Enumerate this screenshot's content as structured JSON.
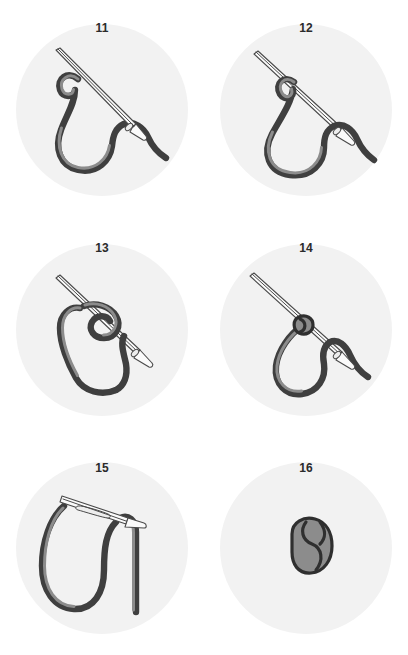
{
  "figure": {
    "background_color": "#ffffff",
    "disc_color": "#f2f2f2",
    "cord_color": "#3f3f3f",
    "cord_highlight_color": "#8c8c8c",
    "needle_color": "#fbfbfb",
    "needle_outline_color": "#4a4a4a",
    "number_color": "#2b2b2b"
  },
  "panels": [
    {
      "number": "11",
      "name": "panel-step-11",
      "description": "Needle held diagonally with cord forming an open hook-shaped loop beside it"
    },
    {
      "number": "12",
      "name": "panel-step-12",
      "description": "Cord loop wrapped once around the needle shaft forming a teardrop loop"
    },
    {
      "number": "13",
      "name": "panel-step-13",
      "description": "Wraps gathered into a coil sliding along the needle shaft"
    },
    {
      "number": "14",
      "name": "panel-step-14",
      "description": "Coil cinched into a compact knot on the needle shaft"
    },
    {
      "number": "15",
      "name": "panel-step-15",
      "description": "Needle pulled through leaving the knotted loop of cord"
    },
    {
      "number": "16",
      "name": "panel-step-16",
      "description": "Finished tightened knot shown on its own"
    }
  ]
}
